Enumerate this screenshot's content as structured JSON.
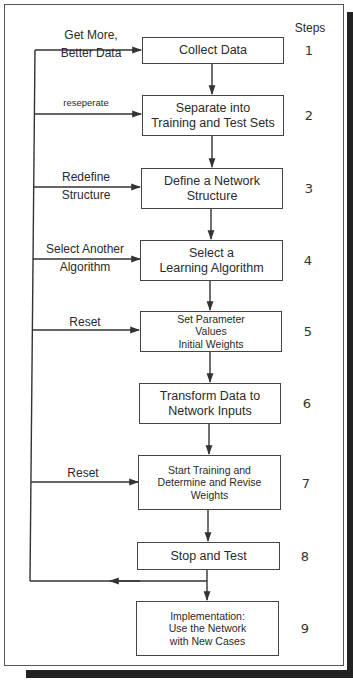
{
  "header": {
    "steps_label": "Steps"
  },
  "boxes": [
    {
      "step": "1",
      "lines": [
        "Collect Data"
      ]
    },
    {
      "step": "2",
      "lines": [
        "Separate into",
        "Training and Test Sets"
      ]
    },
    {
      "step": "3",
      "lines": [
        "Define a Network",
        "Structure"
      ]
    },
    {
      "step": "4",
      "lines": [
        "Select a",
        "Learning Algorithm"
      ]
    },
    {
      "step": "5",
      "lines": [
        "Set Parameter",
        "Values",
        "Initial Weights"
      ]
    },
    {
      "step": "6",
      "lines": [
        "Transform Data to",
        "Network Inputs"
      ]
    },
    {
      "step": "7",
      "lines": [
        "Start Training and",
        "Determine and Revise",
        "Weights"
      ]
    },
    {
      "step": "8",
      "lines": [
        "Stop and Test"
      ]
    },
    {
      "step": "9",
      "lines": [
        "Implementation:",
        "Use the Network",
        "with New Cases"
      ]
    }
  ],
  "feedback_labels": [
    {
      "target_step": "1",
      "lines": [
        "Get More,",
        "Better Data"
      ]
    },
    {
      "target_step": "2",
      "lines": [
        "reseperate"
      ]
    },
    {
      "target_step": "3",
      "lines": [
        "Redefine",
        "Structure"
      ]
    },
    {
      "target_step": "4",
      "lines": [
        "Select Another",
        "Algorithm"
      ]
    },
    {
      "target_step": "5",
      "lines": [
        "Reset"
      ]
    },
    {
      "target_step": "7",
      "lines": [
        "Reset"
      ]
    }
  ],
  "colors": {
    "line": "#333333",
    "frame": "#555555",
    "shadow": "#222222",
    "text": "#2a2a2a"
  }
}
